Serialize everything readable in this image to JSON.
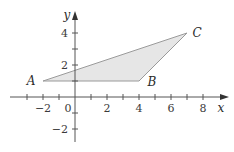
{
  "diagram": {
    "type": "coordinate-plane-triangle",
    "axes": {
      "x_label": "x",
      "y_label": "y",
      "x_range": [
        -3,
        8.5
      ],
      "y_range": [
        -2.8,
        4.7
      ],
      "x_tick_labels": [
        "−2",
        "0",
        "2",
        "4",
        "6",
        "8"
      ],
      "y_tick_labels": [
        "4",
        "2",
        "−2"
      ]
    },
    "points": [
      {
        "label": "A",
        "x": -2,
        "y": 1
      },
      {
        "label": "B",
        "x": 4,
        "y": 1
      },
      {
        "label": "C",
        "x": 7,
        "y": 4
      }
    ],
    "colors": {
      "fill": "#e6e6e6",
      "edge": "#9a9a9a",
      "axis": "#555555",
      "text": "#2a2a2a"
    }
  }
}
